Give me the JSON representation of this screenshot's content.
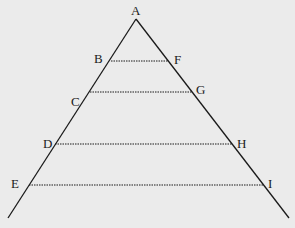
{
  "diagram": {
    "type": "triangle-with-parallel-segments",
    "colors": {
      "background": "#ebebeb",
      "stroke": "#1a1a1a"
    },
    "apex": {
      "label": "A",
      "x": 136,
      "y": 19
    },
    "sides": {
      "left_end": {
        "x": 8,
        "y": 218
      },
      "right_end": {
        "x": 289,
        "y": 218
      }
    },
    "segments": [
      {
        "left": "B",
        "right": "F",
        "y": 61,
        "x1": 111,
        "x2": 168
      },
      {
        "left": "C",
        "right": "G",
        "y": 92,
        "x1": 90,
        "x2": 192
      },
      {
        "left": "D",
        "right": "H",
        "y": 144,
        "x1": 55,
        "x2": 232
      },
      {
        "left": "E",
        "right": "I",
        "y": 185,
        "x1": 29,
        "x2": 264
      }
    ],
    "labels": {
      "A": "A",
      "B": "B",
      "C": "C",
      "D": "D",
      "E": "E",
      "F": "F",
      "G": "G",
      "H": "H",
      "I": "I"
    }
  }
}
